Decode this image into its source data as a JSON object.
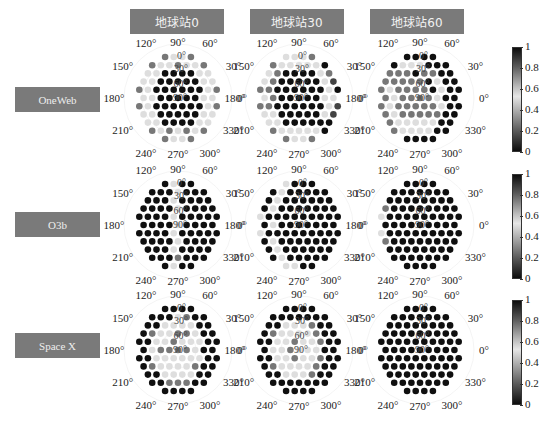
{
  "chart_data": {
    "type": "heatmap",
    "subtype": "polar-hex-dot-grid",
    "title": "",
    "column_headers": [
      "地球站0",
      "地球站30",
      "地球站60"
    ],
    "row_headers": [
      "OneWeb",
      "O3b",
      "Space X"
    ],
    "angular_labels": [
      "0°",
      "30°",
      "60°",
      "90°",
      "120°",
      "150°",
      "180°",
      "210°",
      "240°",
      "270°",
      "300°",
      "330°"
    ],
    "radial_labels": [
      "0°",
      "30°",
      "60°",
      "90°"
    ],
    "colorbar": {
      "min": 0,
      "max": 1,
      "ticks": [
        "0",
        "0.2",
        "0.4",
        "0.6",
        "0.8",
        "1"
      ],
      "colormap": "grayscale, black at 0 and 1, lightest near 0.55"
    },
    "grid_row_lengths": [
      4,
      7,
      8,
      9,
      10,
      9,
      10,
      9,
      8,
      7,
      4
    ],
    "value_encoding": "each digit d => value d/9",
    "panels": [
      {
        "row": "OneWeb",
        "col": "地球站0",
        "rows": [
          "7557",
          "7557557",
          "55999955",
          "559999955",
          "7599999957",
          "559999955",
          "7599999957",
          "559999955",
          "55999955",
          "7575757",
          "7557"
        ]
      },
      {
        "row": "OneWeb",
        "col": "地球站30",
        "rows": [
          "5557",
          "7555559",
          "57999957",
          "579999958",
          "7799999959",
          "579999955",
          "7799999958",
          "559999958",
          "55999999",
          "7555559",
          "7557"
        ]
      },
      {
        "row": "OneWeb",
        "col": "地球站60",
        "rows": [
          "9999",
          "9555999",
          "77797799",
          "777779599",
          "7577779599",
          "757777599",
          "7577777599",
          "757777799",
          "75555599",
          "7555599",
          "9999"
        ]
      },
      {
        "row": "O3b",
        "col": "地球站0",
        "rows": [
          "9599",
          "9995999",
          "99959999",
          "999959999",
          "9999599999",
          "999959999",
          "9999599999",
          "999959999",
          "99959999",
          "9997999",
          "9599"
        ]
      },
      {
        "row": "O3b",
        "col": "地球站30",
        "rows": [
          "5999",
          "9599999",
          "95999999",
          "959999999",
          "5999999999",
          "959999999",
          "5999999999",
          "959999999",
          "95999999",
          "9599999",
          "5599"
        ]
      },
      {
        "row": "O3b",
        "col": "地球站60",
        "rows": [
          "9999",
          "9999999",
          "99999999",
          "799999999",
          "5999999999",
          "999999999",
          "5999999999",
          "799999999",
          "99999999",
          "9999999",
          "9999"
        ]
      },
      {
        "row": "Space X",
        "col": "地球站0",
        "rows": [
          "9999",
          "9995799",
          "99555599",
          "975577599",
          "9955755599",
          "957777599",
          "9955555599",
          "975555799",
          "99555599",
          "9977799",
          "9999"
        ]
      },
      {
        "row": "Space X",
        "col": "地球站30",
        "rows": [
          "9999",
          "9999999",
          "99555799",
          "975555799",
          "9955755799",
          "955755599",
          "9955755799",
          "975555799",
          "99555799",
          "9999999",
          "9999"
        ]
      },
      {
        "row": "Space X",
        "col": "地球站60",
        "rows": [
          "9999",
          "9999999",
          "99999999",
          "999999999",
          "9999999999",
          "999999999",
          "9999999999",
          "999999999",
          "99999999",
          "9999999",
          "9999"
        ]
      }
    ]
  },
  "headers": {
    "col0": "地球站0",
    "col1": "地球站30",
    "col2": "地球站60",
    "row0": "OneWeb",
    "row1": "O3b",
    "row2": "Space X"
  },
  "colorbar_ticks": [
    "1",
    "0.8",
    "0.6",
    "0.4",
    "0.2",
    "0"
  ]
}
